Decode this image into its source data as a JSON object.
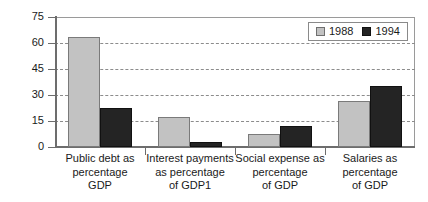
{
  "chart_data": {
    "type": "bar",
    "title": "",
    "xlabel": "",
    "ylabel": "",
    "ylim": [
      0,
      75
    ],
    "yticks": [
      0,
      15,
      30,
      45,
      60,
      75
    ],
    "grid": true,
    "legend_position": "top-right",
    "categories": [
      "Public debt as percentage GDP",
      "Interest payments as percentage of GDP1",
      "Social expense as percentage of GDP",
      "Salaries as percentage of GDP"
    ],
    "category_lines": [
      [
        "Public debt as",
        "percentage",
        "GDP"
      ],
      [
        "Interest payments",
        "as percentage",
        "of GDP1"
      ],
      [
        "Social expense as",
        "percentage",
        "of GDP"
      ],
      [
        "Salaries as",
        "percentage",
        "of GDP"
      ]
    ],
    "series": [
      {
        "name": "1988",
        "color": "#c2c2c2",
        "values": [
          63.5,
          17.5,
          7.5,
          26.5
        ]
      },
      {
        "name": "1994",
        "color": "#242424",
        "values": [
          22.5,
          3.0,
          12.0,
          35.0
        ]
      }
    ]
  },
  "legend": {
    "items": [
      {
        "label": "1988",
        "swatch": "light-gray-swatch"
      },
      {
        "label": "1994",
        "swatch": "dark-swatch"
      }
    ]
  },
  "axis": {
    "y_tick_labels": [
      "0",
      "15",
      "30",
      "45",
      "60",
      "75"
    ]
  }
}
